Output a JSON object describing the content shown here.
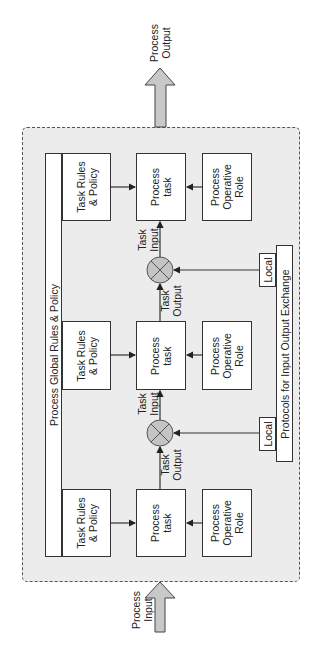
{
  "diagram": {
    "process_output_label": "Process\nOutput",
    "process_input_label": "Process\nInput",
    "global_rules_label": "Process Global Rules & Policy",
    "protocols_label": "Protocols for Input Output Exchange",
    "stages": [
      {
        "task_rules": "Task Rules\n& Policy",
        "process_task": "Process\ntask",
        "operative_role": "Process\nOperative\nRole"
      },
      {
        "task_rules": "Task Rules\n& Policy",
        "process_task": "Process\ntask",
        "operative_role": "Process\nOperative\nRole"
      },
      {
        "task_rules": "Task Rules\n& Policy",
        "process_task": "Process\ntask",
        "operative_role": "Process\nOperative\nRole"
      }
    ],
    "junctions": [
      {
        "output_label": "Task\nOutput",
        "input_label": "Task\nInput",
        "local_label": "Local"
      },
      {
        "output_label": "Task\nOutput",
        "input_label": "Task\nInput",
        "local_label": "Local"
      }
    ],
    "colors": {
      "container_fill": "#ececec",
      "arrow_fill": "#c8c8c8",
      "junction_fill": "#c4c4c4",
      "stroke": "#333333"
    }
  }
}
